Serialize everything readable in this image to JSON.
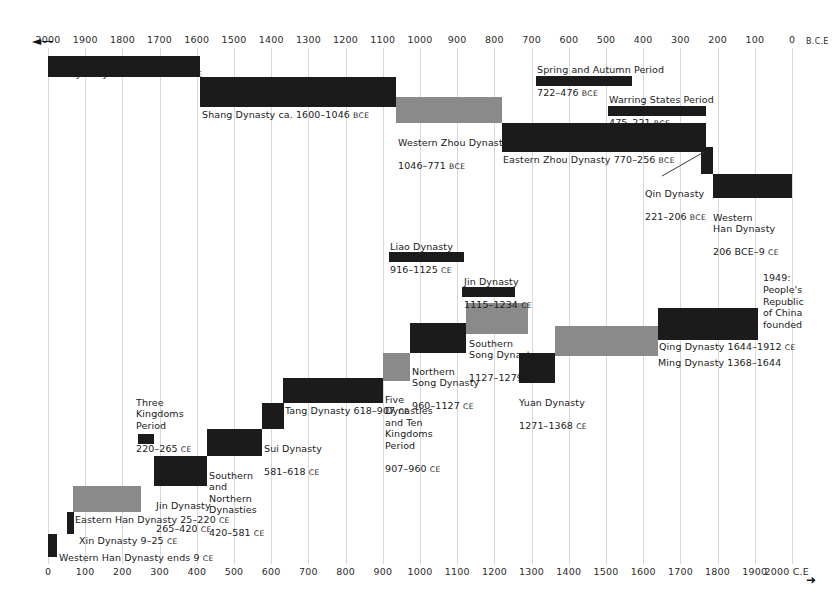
{
  "chart_data": {
    "type": "bar",
    "xlabel_left": "B.C.E",
    "xlabel_right": "2000 C.E",
    "grid": true,
    "legend": "none",
    "top_axis": {
      "direction": "right-to-left",
      "era": "B.C.E",
      "ticks": [
        2000,
        1900,
        1800,
        1700,
        1600,
        1500,
        1400,
        1300,
        1200,
        1100,
        1000,
        900,
        800,
        700,
        600,
        500,
        400,
        300,
        200,
        100,
        0
      ]
    },
    "bottom_axis": {
      "direction": "left-to-right",
      "era": "C.E",
      "ticks": [
        0,
        100,
        200,
        300,
        400,
        500,
        600,
        700,
        800,
        900,
        1000,
        1100,
        1200,
        1300,
        1400,
        1500,
        1600,
        1700,
        1800,
        1900,
        2000
      ]
    },
    "bars": [
      {
        "name": "Xia Dynasty",
        "label": "Xia Dynasty",
        "range": "ca. 2100–1600 BCE",
        "start": -2100,
        "end": -1600,
        "shade": "dark"
      },
      {
        "name": "Shang Dynasty",
        "label": "Shang Dynasty",
        "range": "ca. 1600–1046 BCE",
        "start": -1600,
        "end": -1046,
        "shade": "dark"
      },
      {
        "name": "Western Zhou Dynasty",
        "label": "Western Zhou Dynasty",
        "range": "1046–771 BCE",
        "start": -1046,
        "end": -771,
        "shade": "gray"
      },
      {
        "name": "Eastern Zhou Dynasty",
        "label": "Eastern Zhou Dynasty",
        "range": "770–256 BCE",
        "start": -770,
        "end": -256,
        "shade": "dark"
      },
      {
        "name": "Spring and Autumn Period",
        "label": "Spring and Autumn Period",
        "range": "722–476 BCE",
        "start": -722,
        "end": -476,
        "shade": "dark"
      },
      {
        "name": "Warring States Period",
        "label": "Warring States Period",
        "range": "475–221 BCE",
        "start": -475,
        "end": -221,
        "shade": "dark"
      },
      {
        "name": "Qin Dynasty",
        "label": "Qin Dynasty",
        "range": "221–206 BCE",
        "start": -221,
        "end": -206,
        "shade": "dark"
      },
      {
        "name": "Western Han Dynasty",
        "label": "Western Han Dynasty",
        "range": "206 BCE–9 CE",
        "start": -206,
        "end": 9,
        "shade": "dark"
      },
      {
        "name": "Western Han Dynasty ends",
        "label": "Western Han Dynasty ends",
        "range": "9 CE",
        "start": 6,
        "end": 12,
        "shade": "dark"
      },
      {
        "name": "Xin Dynasty",
        "label": "Xin Dynasty",
        "range": "9–25 CE",
        "start": 9,
        "end": 25,
        "shade": "dark"
      },
      {
        "name": "Eastern Han Dynasty",
        "label": "Eastern Han Dynasty",
        "range": "25–220 CE",
        "start": 25,
        "end": 220,
        "shade": "gray"
      },
      {
        "name": "Three Kingdoms Period",
        "label": "Three Kingdoms Period",
        "range": "220–265 CE",
        "start": 220,
        "end": 265,
        "shade": "dark"
      },
      {
        "name": "Jin Dynasty",
        "label": "Jin Dynasty",
        "range": "265–420 CE",
        "start": 265,
        "end": 420,
        "shade": "dark"
      },
      {
        "name": "Southern and Northern Dynasties",
        "label": "Southern and Northern Dynasties",
        "range": "420–581 CE",
        "start": 420,
        "end": 581,
        "shade": "dark"
      },
      {
        "name": "Sui Dynasty",
        "label": "Sui Dynasty",
        "range": "581–618 CE",
        "start": 581,
        "end": 618,
        "shade": "dark"
      },
      {
        "name": "Tang Dynasty",
        "label": "Tang Dynasty",
        "range": "618–907 CE",
        "start": 618,
        "end": 907,
        "shade": "dark"
      },
      {
        "name": "Five Dynasties and Ten Kingdoms Period",
        "label": "Five Dynasties and Ten Kingdoms Period",
        "range": "907–960 CE",
        "start": 907,
        "end": 960,
        "shade": "gray"
      },
      {
        "name": "Liao Dynasty",
        "label": "Liao Dynasty",
        "range": "916–1125 CE",
        "start": 916,
        "end": 1125,
        "shade": "dark"
      },
      {
        "name": "Northern Song Dynasty",
        "label": "Northern Song Dynasty",
        "range": "960–1127 CE",
        "start": 960,
        "end": 1127,
        "shade": "dark"
      },
      {
        "name": "Jin Dynasty (Jurchen)",
        "label": "Jin Dynasty",
        "range": "1115–1234 CE",
        "start": 1115,
        "end": 1234,
        "shade": "dark"
      },
      {
        "name": "Southern Song Dynasty",
        "label": "Southern Song Dynasty",
        "range": "1127–1279 CE",
        "start": 1127,
        "end": 1279,
        "shade": "gray"
      },
      {
        "name": "Yuan Dynasty",
        "label": "Yuan Dynasty",
        "range": "1271–1368 CE",
        "start": 1271,
        "end": 1368,
        "shade": "dark"
      },
      {
        "name": "Ming Dynasty",
        "label": "Ming Dynasty",
        "range": "1368–1644",
        "start": 1368,
        "end": 1644,
        "shade": "gray"
      },
      {
        "name": "Qing Dynasty",
        "label": "Qing Dynasty",
        "range": "1644–1912 CE",
        "start": 1644,
        "end": 1912,
        "shade": "dark"
      }
    ],
    "annotations": [
      {
        "name": "prc-founded",
        "text": "1949:\nPeople's\nRepublic\nof China\nfounded"
      }
    ]
  },
  "labels": {
    "xia": "Xia Dynasty  ca. 2100–1600 ",
    "xia_era": "BCE",
    "shang": "Shang Dynasty  ca. 1600–1046 ",
    "shang_era": "BCE",
    "spring_l1": "Spring and Autumn Period",
    "spring_l2": "722–476 ",
    "spring_era": "BCE",
    "warring_l1": "Warring States Period",
    "warring_l2": "475–221 ",
    "warring_era": "BCE",
    "wzhou_l1": "Western Zhou Dynasty",
    "wzhou_l2": "1046–771 ",
    "wzhou_era": "BCE",
    "ezhou": "Eastern Zhou Dynasty  770–256 ",
    "ezhou_era": "BCE",
    "qin_l1": "Qin Dynasty",
    "qin_l2": "221–206 ",
    "qin_era": "BCE",
    "whan_l1": "Western\nHan Dynasty",
    "whan_l2": "206 BCE–9 ",
    "whan_era": "CE",
    "prc": "1949:\nPeople's\nRepublic\nof China\nfounded",
    "liao_l1": "Liao Dynasty",
    "liao_l2": "916–1125 ",
    "liao_era": "CE",
    "jinj_l1": "Jin Dynasty",
    "jinj_l2": "1115–1234 ",
    "jinj_era": "CE",
    "ssong_l1": "Southern\nSong Dynasty",
    "ssong_l2": "1127–1279 ",
    "ssong_era": "CE",
    "qing": "Qing Dynasty  1644–1912 ",
    "qing_era": "CE",
    "nsong_l1": "Northern\nSong Dynasty",
    "nsong_l2": "960–1127 ",
    "nsong_era": "CE",
    "ming": "Ming Dynasty 1368–1644",
    "yuan_l1": "Yuan Dynasty",
    "yuan_l2": "1271–1368 ",
    "yuan_era": "CE",
    "five_l1": "Five\nDynasties\nand Ten\nKingdoms\nPeriod",
    "five_l2": "907–960 ",
    "five_era": "CE",
    "tang": "Tang Dynasty  618–907 ",
    "tang_era": "CE",
    "three_l1": "Three\nKingdoms\nPeriod",
    "three_l2": "220–265 ",
    "three_era": "CE",
    "sui_l1": "Sui Dynasty",
    "sui_l2": "581–618 ",
    "sui_era": "CE",
    "snd_l1": "Southern\nand\nNorthern\nDynasties",
    "snd_l2": "420–581 ",
    "snd_era": "CE",
    "jin_l1": "Jin Dynasty",
    "jin_l2": "265–420 ",
    "jin_era": "CE",
    "ehan": "Eastern Han Dynasty  25–220 ",
    "ehan_era": "CE",
    "xin": "Xin Dynasty  9–25 ",
    "xin_era": "CE",
    "whan_end": "Western Han Dynasty ends 9 ",
    "whan_end_era": "CE",
    "bce_label": "B.C.E",
    "ce_label": "2000 C.E",
    "arrow_left": "◄—",
    "arrow_right": "➜"
  }
}
